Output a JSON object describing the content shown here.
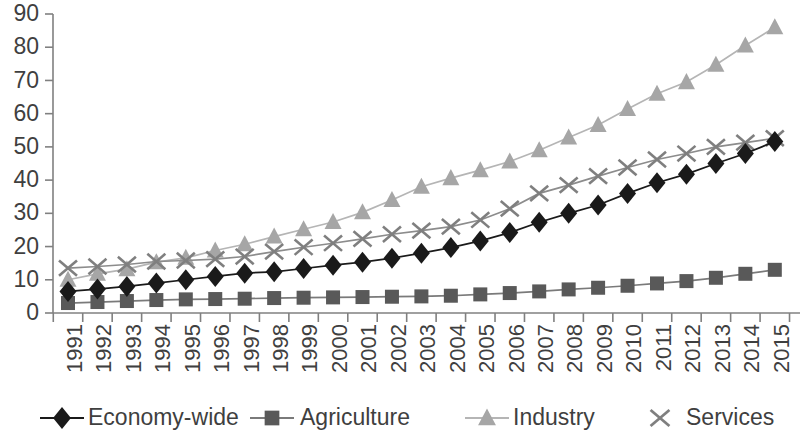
{
  "chart_data": {
    "type": "line",
    "title": "",
    "subtitle": "",
    "xlabel": "",
    "ylabel": "",
    "xlim": [
      1991,
      2015
    ],
    "ylim": [
      0,
      90
    ],
    "ytick_step": 10,
    "grid": false,
    "legend_position": "bottom",
    "categories": [
      "1991",
      "1992",
      "1993",
      "1994",
      "1995",
      "1996",
      "1997",
      "1998",
      "1999",
      "2000",
      "2001",
      "2002",
      "2003",
      "2004",
      "2005",
      "2006",
      "2007",
      "2008",
      "2009",
      "2010",
      "2011",
      "2012",
      "2013",
      "2014",
      "2015"
    ],
    "yticks": [
      "0",
      "10",
      "20",
      "30",
      "40",
      "50",
      "60",
      "70",
      "80",
      "90"
    ],
    "series": [
      {
        "name": "Economy-wide",
        "marker": "diamond",
        "color": "#1a1a1a",
        "line_color": "#1a1a1a",
        "values": [
          6.5,
          7.2,
          8.0,
          9.0,
          10.0,
          11.0,
          12.0,
          12.4,
          13.4,
          14.4,
          15.3,
          16.5,
          18.0,
          19.7,
          21.7,
          24.2,
          27.3,
          30.0,
          32.5,
          36.0,
          39.2,
          41.8,
          45.0,
          48.0,
          51.6
        ]
      },
      {
        "name": "Agriculture",
        "marker": "square",
        "color": "#595959",
        "line_color": "#7a7a7a",
        "values": [
          3.0,
          3.3,
          3.6,
          3.9,
          4.1,
          4.2,
          4.3,
          4.5,
          4.6,
          4.7,
          4.8,
          4.9,
          5.0,
          5.2,
          5.6,
          6.0,
          6.5,
          7.1,
          7.6,
          8.2,
          8.9,
          9.6,
          10.6,
          11.8,
          13.0
        ]
      },
      {
        "name": "Industry",
        "marker": "triangle",
        "color": "#a6a6a6",
        "line_color": "#b5b5b5",
        "values": [
          10.0,
          11.8,
          13.2,
          15.3,
          16.6,
          18.8,
          20.7,
          23.0,
          25.2,
          27.4,
          30.3,
          34.0,
          38.0,
          40.6,
          43.0,
          45.6,
          49.0,
          52.8,
          56.6,
          61.4,
          66.0,
          69.5,
          74.7,
          80.5,
          86.0
        ]
      },
      {
        "name": "Services",
        "marker": "x",
        "color": "#7f7f7f",
        "line_color": "#8c8c8c",
        "values": [
          13.5,
          14.0,
          14.6,
          15.5,
          15.8,
          16.2,
          17.0,
          18.5,
          19.8,
          21.0,
          22.3,
          23.7,
          24.8,
          26.0,
          28.0,
          31.4,
          36.0,
          38.5,
          41.2,
          43.8,
          46.2,
          48.0,
          50.0,
          51.3,
          52.6
        ]
      }
    ]
  },
  "legend": {
    "items": [
      {
        "label": "Economy-wide",
        "marker": "diamond-icon",
        "color": "#1a1a1a"
      },
      {
        "label": "Agriculture",
        "marker": "square-icon",
        "color": "#595959"
      },
      {
        "label": "Industry",
        "marker": "triangle-icon",
        "color": "#a6a6a6"
      },
      {
        "label": "Services",
        "marker": "x-icon",
        "color": "#7f7f7f"
      }
    ]
  }
}
